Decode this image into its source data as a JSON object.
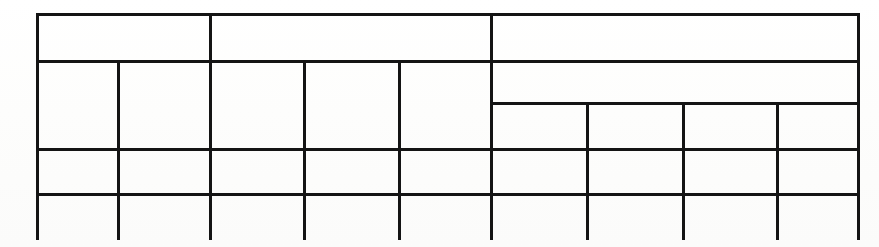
{
  "document": {
    "type": "scanned-table",
    "title": "Blank ruled table grid",
    "background_color": "#fdfdfd",
    "line_color": "#141414",
    "canvas": {
      "width": 879,
      "height": 247
    }
  },
  "grid": {
    "left": 36,
    "right": 857,
    "top": 13,
    "bottom": 240,
    "bottom_open": true,
    "column_x": [
      36,
      117,
      209,
      303,
      398,
      490,
      586,
      682,
      776,
      857
    ],
    "row_y": [
      13,
      60,
      102,
      148,
      193,
      240
    ],
    "line_width_px": 3
  },
  "rules": {
    "horizontal": [
      {
        "name": "top-border",
        "x": 36,
        "y": 13,
        "w": 821
      },
      {
        "name": "header-row-divider",
        "x": 36,
        "y": 60,
        "w": 821
      },
      {
        "name": "subheader-divider",
        "x": 490,
        "y": 102,
        "w": 367
      },
      {
        "name": "body-row-1-divider",
        "x": 36,
        "y": 148,
        "w": 821
      },
      {
        "name": "body-row-2-divider",
        "x": 36,
        "y": 193,
        "w": 821
      }
    ],
    "vertical": [
      {
        "name": "left-border",
        "x": 36,
        "y": 13,
        "h": 227
      },
      {
        "name": "col-divider-1",
        "x": 117,
        "y": 60,
        "h": 180
      },
      {
        "name": "col-divider-2",
        "x": 209,
        "y": 13,
        "h": 227
      },
      {
        "name": "col-divider-3",
        "x": 303,
        "y": 60,
        "h": 180
      },
      {
        "name": "col-divider-4",
        "x": 398,
        "y": 60,
        "h": 180
      },
      {
        "name": "col-divider-5",
        "x": 490,
        "y": 13,
        "h": 227
      },
      {
        "name": "sub-col-divider-1",
        "x": 586,
        "y": 102,
        "h": 138
      },
      {
        "name": "sub-col-divider-2",
        "x": 682,
        "y": 102,
        "h": 138
      },
      {
        "name": "sub-col-divider-3",
        "x": 776,
        "y": 102,
        "h": 138
      },
      {
        "name": "right-border",
        "x": 857,
        "y": 13,
        "h": 227
      }
    ]
  },
  "cells": {
    "header_row": [
      {
        "name": "header-cell-1",
        "text": "",
        "x": 36,
        "y": 13,
        "w": 173,
        "h": 47
      },
      {
        "name": "header-cell-2",
        "text": "",
        "x": 209,
        "y": 13,
        "w": 281,
        "h": 47
      },
      {
        "name": "header-cell-3",
        "text": "",
        "x": 490,
        "y": 13,
        "w": 367,
        "h": 47
      }
    ],
    "subheader_row": [
      {
        "name": "subheader-cell-1",
        "text": "",
        "x": 36,
        "y": 60,
        "w": 81,
        "h": 88
      },
      {
        "name": "subheader-cell-2",
        "text": "",
        "x": 117,
        "y": 60,
        "w": 92,
        "h": 88
      },
      {
        "name": "subheader-cell-3",
        "text": "",
        "x": 209,
        "y": 60,
        "w": 94,
        "h": 88
      },
      {
        "name": "subheader-cell-4",
        "text": "",
        "x": 303,
        "y": 60,
        "w": 95,
        "h": 88
      },
      {
        "name": "subheader-cell-5",
        "text": "",
        "x": 398,
        "y": 60,
        "w": 92,
        "h": 88
      },
      {
        "name": "subheader-group-span",
        "text": "",
        "x": 490,
        "y": 60,
        "w": 367,
        "h": 42
      },
      {
        "name": "subheader-sub-cell-1",
        "text": "",
        "x": 490,
        "y": 102,
        "w": 96,
        "h": 46
      },
      {
        "name": "subheader-sub-cell-2",
        "text": "",
        "x": 586,
        "y": 102,
        "w": 96,
        "h": 46
      },
      {
        "name": "subheader-sub-cell-3",
        "text": "",
        "x": 682,
        "y": 102,
        "w": 94,
        "h": 46
      },
      {
        "name": "subheader-sub-cell-4",
        "text": "",
        "x": 776,
        "y": 102,
        "w": 81,
        "h": 46
      }
    ],
    "body_row_1": [
      {
        "name": "body-r1-c1",
        "text": "",
        "x": 36,
        "y": 148,
        "w": 81,
        "h": 45
      },
      {
        "name": "body-r1-c2",
        "text": "",
        "x": 117,
        "y": 148,
        "w": 92,
        "h": 45
      },
      {
        "name": "body-r1-c3",
        "text": "",
        "x": 209,
        "y": 148,
        "w": 94,
        "h": 45
      },
      {
        "name": "body-r1-c4",
        "text": "",
        "x": 303,
        "y": 148,
        "w": 95,
        "h": 45
      },
      {
        "name": "body-r1-c5",
        "text": "",
        "x": 398,
        "y": 148,
        "w": 92,
        "h": 45
      },
      {
        "name": "body-r1-c6",
        "text": "",
        "x": 490,
        "y": 148,
        "w": 96,
        "h": 45
      },
      {
        "name": "body-r1-c7",
        "text": "",
        "x": 586,
        "y": 148,
        "w": 96,
        "h": 45
      },
      {
        "name": "body-r1-c8",
        "text": "",
        "x": 682,
        "y": 148,
        "w": 94,
        "h": 45
      },
      {
        "name": "body-r1-c9",
        "text": "",
        "x": 776,
        "y": 148,
        "w": 81,
        "h": 45
      }
    ],
    "body_row_2": [
      {
        "name": "body-r2-c1",
        "text": "",
        "x": 36,
        "y": 193,
        "w": 81,
        "h": 47
      },
      {
        "name": "body-r2-c2",
        "text": "",
        "x": 117,
        "y": 193,
        "w": 92,
        "h": 47
      },
      {
        "name": "body-r2-c3",
        "text": "",
        "x": 209,
        "y": 193,
        "w": 94,
        "h": 47
      },
      {
        "name": "body-r2-c4",
        "text": "",
        "x": 303,
        "y": 193,
        "w": 95,
        "h": 47
      },
      {
        "name": "body-r2-c5",
        "text": "",
        "x": 398,
        "y": 193,
        "w": 92,
        "h": 47
      },
      {
        "name": "body-r2-c6",
        "text": "",
        "x": 490,
        "y": 193,
        "w": 96,
        "h": 47
      },
      {
        "name": "body-r2-c7",
        "text": "",
        "x": 586,
        "y": 193,
        "w": 96,
        "h": 47
      },
      {
        "name": "body-r2-c8",
        "text": "",
        "x": 682,
        "y": 193,
        "w": 94,
        "h": 47
      },
      {
        "name": "body-r2-c9",
        "text": "",
        "x": 776,
        "y": 193,
        "w": 81,
        "h": 47
      }
    ]
  }
}
